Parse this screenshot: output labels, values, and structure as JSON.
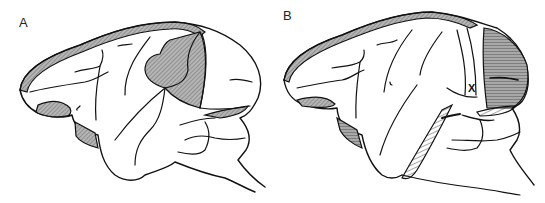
{
  "figure": {
    "panels": [
      {
        "id": "A",
        "label": "A",
        "description": "Lateral view of monkey brain with shaded lesion in parietal/prestriate region and shaded margins"
      },
      {
        "id": "B",
        "label": "B",
        "description": "Lateral view of monkey brain with shaded occipital region, hatched inferior temporal streaks, and marked point",
        "marker": "X"
      }
    ],
    "colors": {
      "outline": "#111111",
      "shade": "#9a9a9a",
      "background": "#ffffff"
    }
  }
}
